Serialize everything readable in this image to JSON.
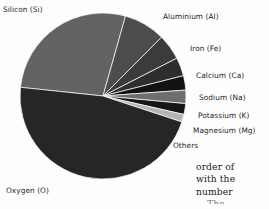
{
  "figure": {
    "name": "earth-crust-composition-pie-chart",
    "background_color": "#fdfdfd"
  },
  "chart_data": {
    "type": "pie",
    "title": "",
    "subtitle": "",
    "xlabel": "",
    "ylabel": "",
    "legend_position": "callout-labels",
    "grid": false,
    "units": "percent by mass",
    "start_angle_deg": 186,
    "direction": "clockwise",
    "center_x": 103,
    "center_y": 96,
    "radius": 83,
    "categories": [
      "Silicon (Si)",
      "Aluminium (Al)",
      "Iron (Fe)",
      "Calcium (Ca)",
      "Sodium (Na)",
      "Potassium (K)",
      "Magnesium (Mg)",
      "Others",
      "Oxygen (O)"
    ],
    "values": [
      27.7,
      8.1,
      5.0,
      3.6,
      2.8,
      2.6,
      2.1,
      1.5,
      46.6
    ],
    "colors": [
      "#636363",
      "#4c4c4c",
      "#3b3b3b",
      "#2e2e2e",
      "#121212",
      "#6e6e6e",
      "#161616",
      "#b5b5b5",
      "#262626"
    ],
    "slices": [
      {
        "label": "Silicon (Si)",
        "value": 27.7,
        "color": "#636363",
        "label_x": 3,
        "label_y": 5
      },
      {
        "label": "Aluminium (Al)",
        "value": 8.1,
        "color": "#4c4c4c",
        "label_x": 163,
        "label_y": 12
      },
      {
        "label": "Iron (Fe)",
        "value": 5.0,
        "color": "#3b3b3b",
        "label_x": 190,
        "label_y": 44
      },
      {
        "label": "Calcium (Ca)",
        "value": 3.6,
        "color": "#2e2e2e",
        "label_x": 196,
        "label_y": 71
      },
      {
        "label": "Sodium (Na)",
        "value": 2.8,
        "color": "#121212",
        "label_x": 199,
        "label_y": 93
      },
      {
        "label": "Potassium (K)",
        "value": 2.6,
        "color": "#6e6e6e",
        "label_x": 198,
        "label_y": 111
      },
      {
        "label": "Magnesium (Mg)",
        "value": 2.1,
        "color": "#161616",
        "label_x": 193,
        "label_y": 126
      },
      {
        "label": "Others",
        "value": 1.5,
        "color": "#b5b5b5",
        "label_x": 173,
        "label_y": 141
      },
      {
        "label": "Oxygen (O)",
        "value": 46.6,
        "color": "#262626",
        "label_x": 6,
        "label_y": 186
      }
    ]
  },
  "labels": {
    "silicon": "Silicon (Si)",
    "aluminium": "Aluminium (Al)",
    "iron": "Iron (Fe)",
    "calcium": "Calcium (Ca)",
    "sodium": "Sodium (Na)",
    "potassium": "Potassium (K)",
    "magnesium": "Magnesium (Mg)",
    "others": "Others",
    "oxygen": "Oxygen (O)"
  },
  "side_text": {
    "line1": "order of",
    "line2": "with the",
    "line3": "number",
    "line4": "The"
  }
}
